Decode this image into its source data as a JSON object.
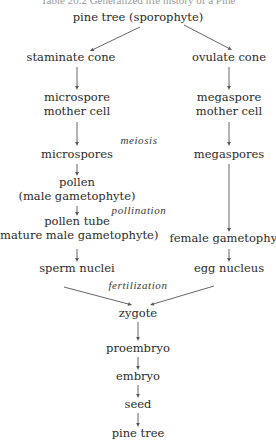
{
  "header": {
    "cut_text": "Table 20.2 Generalized life history of a Pine"
  },
  "diagram": {
    "nodes": [
      {
        "id": "pine_tree_sporophyte",
        "lines": [
          "pine tree (sporophyte)"
        ],
        "x": 138,
        "y": 21
      },
      {
        "id": "staminate_cone",
        "lines": [
          "staminate cone"
        ],
        "x": 71,
        "y": 61
      },
      {
        "id": "ovulate_cone",
        "lines": [
          "ovulate cone"
        ],
        "x": 229,
        "y": 61
      },
      {
        "id": "microspore_mother_cell",
        "lines": [
          "microspore",
          "mother cell"
        ],
        "x": 77,
        "y": 101
      },
      {
        "id": "megaspore_mother_cell",
        "lines": [
          "megaspore",
          "mother cell"
        ],
        "x": 229,
        "y": 101
      },
      {
        "id": "microspores",
        "lines": [
          "microspores"
        ],
        "x": 77,
        "y": 158
      },
      {
        "id": "megaspores",
        "lines": [
          "megaspores"
        ],
        "x": 229,
        "y": 158
      },
      {
        "id": "pollen",
        "lines": [
          "pollen",
          "(male gametophyte)"
        ],
        "x": 77,
        "y": 186
      },
      {
        "id": "pollen_tube",
        "lines": [
          "pollen tube",
          "(mature male gametophyte)"
        ],
        "x": 77,
        "y": 225
      },
      {
        "id": "female_gametophyte",
        "lines": [
          "female gametophyte"
        ],
        "x": 229,
        "y": 242
      },
      {
        "id": "sperm_nuclei",
        "lines": [
          "sperm nuclei"
        ],
        "x": 77,
        "y": 272
      },
      {
        "id": "egg_nucleus",
        "lines": [
          "egg nucleus"
        ],
        "x": 229,
        "y": 272
      },
      {
        "id": "zygote",
        "lines": [
          "zygote"
        ],
        "x": 138,
        "y": 317
      },
      {
        "id": "proembryo",
        "lines": [
          "proembryo"
        ],
        "x": 138,
        "y": 352
      },
      {
        "id": "embryo",
        "lines": [
          "embryo"
        ],
        "x": 138,
        "y": 380
      },
      {
        "id": "seed",
        "lines": [
          "seed"
        ],
        "x": 138,
        "y": 408
      },
      {
        "id": "pine_tree",
        "lines": [
          "pine tree"
        ],
        "x": 138,
        "y": 437
      }
    ],
    "process_labels": [
      {
        "id": "meiosis",
        "text": "meiosis",
        "x": 139,
        "y": 144
      },
      {
        "id": "pollination",
        "text": "pollination",
        "x": 139,
        "y": 214
      },
      {
        "id": "fertilization",
        "text": "fertilization",
        "x": 138,
        "y": 289
      }
    ],
    "edges": [
      {
        "from": "pine_tree_sporophyte",
        "to": "staminate_cone",
        "x1": 140,
        "y1": 27,
        "x2": 90,
        "y2": 51
      },
      {
        "from": "pine_tree_sporophyte",
        "to": "ovulate_cone",
        "x1": 184,
        "y1": 25,
        "x2": 232,
        "y2": 50
      },
      {
        "from": "staminate_cone",
        "to": "microspore_mother_cell",
        "x1": 77,
        "y1": 67,
        "x2": 77,
        "y2": 90
      },
      {
        "from": "ovulate_cone",
        "to": "megaspore_mother_cell",
        "x1": 229,
        "y1": 67,
        "x2": 229,
        "y2": 90
      },
      {
        "from": "microspore_mother_cell",
        "to": "microspores",
        "x1": 77,
        "y1": 122,
        "x2": 77,
        "y2": 146
      },
      {
        "from": "megaspore_mother_cell",
        "to": "megaspores",
        "x1": 229,
        "y1": 122,
        "x2": 229,
        "y2": 146
      },
      {
        "from": "microspores",
        "to": "pollen",
        "x1": 77,
        "y1": 164,
        "x2": 77,
        "y2": 176
      },
      {
        "from": "megaspores",
        "to": "female_gametophyte",
        "x1": 229,
        "y1": 164,
        "x2": 229,
        "y2": 232
      },
      {
        "from": "pollen",
        "to": "pollen_tube",
        "x1": 77,
        "y1": 206,
        "x2": 77,
        "y2": 216
      },
      {
        "from": "pollen_tube",
        "to": "sperm_nuclei",
        "x1": 77,
        "y1": 249,
        "x2": 77,
        "y2": 262
      },
      {
        "from": "female_gametophyte",
        "to": "egg_nucleus",
        "x1": 229,
        "y1": 249,
        "x2": 229,
        "y2": 262
      },
      {
        "from": "sperm_nuclei",
        "to": "zygote",
        "x1": 64,
        "y1": 287,
        "x2": 132,
        "y2": 305
      },
      {
        "from": "egg_nucleus",
        "to": "zygote",
        "x1": 214,
        "y1": 286,
        "x2": 150,
        "y2": 305
      },
      {
        "from": "zygote",
        "to": "proembryo",
        "x1": 138,
        "y1": 322,
        "x2": 138,
        "y2": 341
      },
      {
        "from": "proembryo",
        "to": "embryo",
        "x1": 138,
        "y1": 357,
        "x2": 138,
        "y2": 370
      },
      {
        "from": "embryo",
        "to": "seed",
        "x1": 138,
        "y1": 385,
        "x2": 138,
        "y2": 398
      },
      {
        "from": "seed",
        "to": "pine_tree",
        "x1": 138,
        "y1": 413,
        "x2": 138,
        "y2": 427
      }
    ]
  }
}
